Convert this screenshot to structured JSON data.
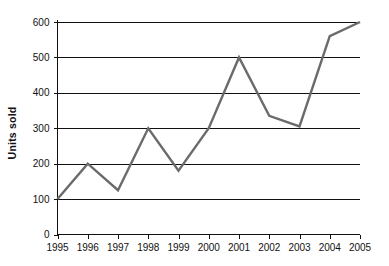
{
  "chart_data": {
    "type": "line",
    "title": "",
    "subtitle": "",
    "xlabel": "",
    "ylabel": "Units sold",
    "categories": [
      "1995",
      "1996",
      "1997",
      "1998",
      "1999",
      "2000",
      "2001",
      "2002",
      "2003",
      "2004",
      "2005"
    ],
    "x": [
      1995,
      1996,
      1997,
      1998,
      1999,
      2000,
      2001,
      2002,
      2003,
      2004,
      2005
    ],
    "values": [
      100,
      200,
      125,
      300,
      180,
      300,
      500,
      335,
      305,
      560,
      600
    ],
    "series": [
      {
        "name": "Units sold",
        "values": [
          100,
          200,
          125,
          300,
          180,
          300,
          500,
          335,
          305,
          560,
          600
        ],
        "color": "#6b6b6b"
      }
    ],
    "ylim": [
      0,
      600
    ],
    "ytick_labels": [
      "0",
      "100",
      "200",
      "300",
      "400",
      "500",
      "600"
    ],
    "ytick_values": [
      0,
      100,
      200,
      300,
      400,
      500,
      600
    ],
    "xtick_labels": [
      "1995",
      "1996",
      "1997",
      "1998",
      "1999",
      "2000",
      "2001",
      "2002",
      "2003",
      "2004",
      "2005"
    ],
    "grid": true,
    "grid_axis": "y",
    "legend": false,
    "legend_position": "none",
    "markers": false,
    "annotations": []
  },
  "style": {
    "line_color": "#6b6b6b",
    "axis_color": "#111111",
    "grid_color": "#111111",
    "background": "#ffffff",
    "text_color": "#111111"
  },
  "labels": {
    "y_axis_title": "Units sold"
  }
}
